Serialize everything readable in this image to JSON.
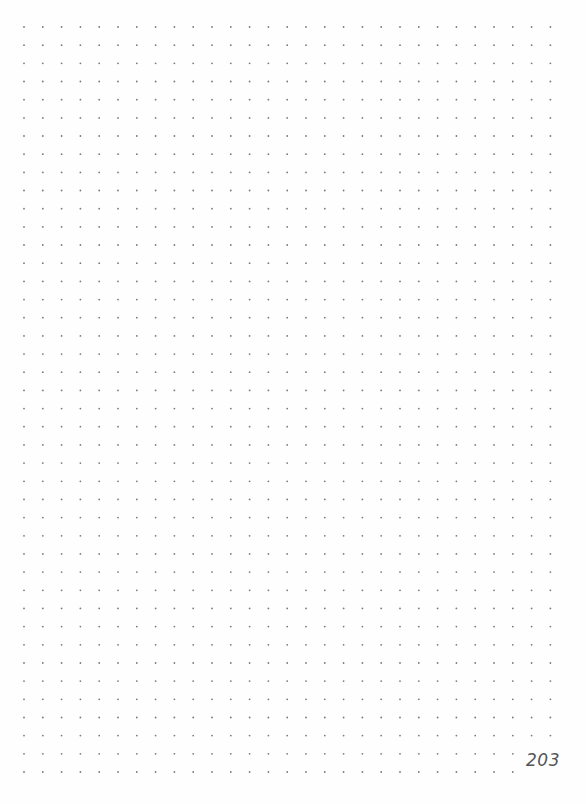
{
  "page": {
    "type": "dot-grid notebook page",
    "page_number": "203",
    "grid": {
      "columns": 29,
      "rows": 42,
      "x_start": 24,
      "x_spacing": 18.8,
      "y_start": 27,
      "y_spacing": 18.17,
      "dot_color": "#7a7a7a",
      "dot_radius": 0.9
    }
  }
}
